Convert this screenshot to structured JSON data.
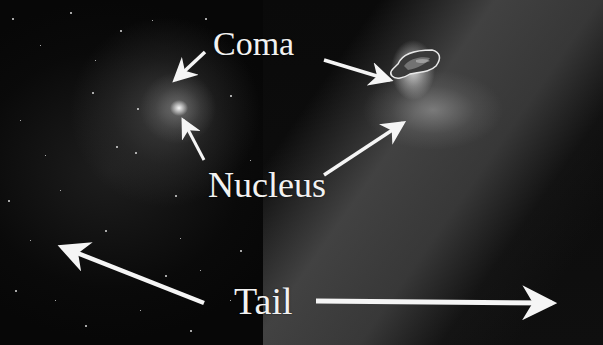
{
  "figure": {
    "panels": [
      {
        "id": "left",
        "depicts": "comet viewed from distance: diffuse coma with bright central nucleus against star field"
      },
      {
        "id": "right",
        "depicts": "close-up image of comet nucleus with bright jets and gray dust tail"
      }
    ]
  },
  "labels": {
    "coma": "Coma",
    "nucleus": "Nucleus",
    "tail": "Tail"
  },
  "arrows": [
    {
      "name": "coma-arrow-left",
      "from_label": "Coma",
      "points_to": "left-panel coma"
    },
    {
      "name": "coma-arrow-right",
      "from_label": "Coma",
      "points_to": "right-panel coma"
    },
    {
      "name": "nucleus-arrow-left",
      "from_label": "Nucleus",
      "points_to": "left-panel nucleus"
    },
    {
      "name": "nucleus-arrow-right",
      "from_label": "Nucleus",
      "points_to": "right-panel nucleus"
    },
    {
      "name": "tail-arrow-left",
      "from_label": "Tail",
      "points_to": "upper-left"
    },
    {
      "name": "tail-arrow-right",
      "from_label": "Tail",
      "points_to": "right"
    }
  ],
  "colors": {
    "background": "#050505",
    "label_text": "#f2f2f2",
    "arrow": "#f5f5f5",
    "coma_glow": "#9a9a9a",
    "tail_haze": "#4b4b4b"
  }
}
